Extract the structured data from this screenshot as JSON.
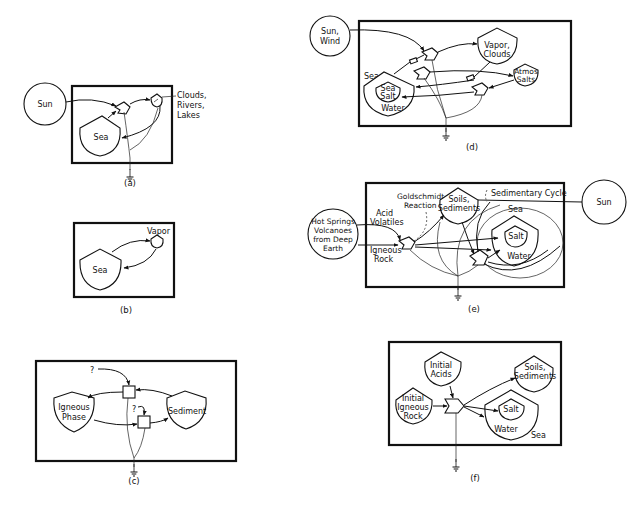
{
  "panels": {
    "a": {
      "caption": "(a)",
      "sun": "Sun",
      "sea": "Sea",
      "clouds_l1": "Clouds,",
      "clouds_l2": "Rivers,",
      "clouds_l3": "Lakes"
    },
    "b": {
      "caption": "(b)",
      "sea": "Sea",
      "vapor": "Vapor"
    },
    "c": {
      "caption": "(c)",
      "igneous_l1": "Igneous",
      "igneous_l2": "Phase",
      "sediment": "Sediment",
      "q1": "?",
      "q2": "?"
    },
    "d": {
      "caption": "(d)",
      "sun_l1": "Sun,",
      "sun_l2": "Wind",
      "sea": "Sea",
      "seasalt_l1": "Sea",
      "seasalt_l2": "Salt",
      "water": "Water",
      "vapor_l1": "Vapor,",
      "vapor_l2": "Clouds",
      "atmos_l1": "Atmos",
      "atmos_l2": "Salts"
    },
    "e": {
      "caption": "(e)",
      "hot_l1": "Hot Springs",
      "hot_l2": "Volcanoes",
      "hot_l3": "from Deep",
      "hot_l4": "Earth",
      "acid_l1": "Acid",
      "acid_l2": "Volatiles",
      "igneous_l1": "Igneous",
      "igneous_l2": "Rock",
      "gold_l1": "Goldschmidt",
      "gold_l2": "Reaction",
      "soils_l1": "Soils,",
      "soils_l2": "Sediments",
      "sedcycle": "Sedimentary Cycle",
      "sea": "Sea",
      "salt": "Salt",
      "water": "Water",
      "sun": "Sun"
    },
    "f": {
      "caption": "(f)",
      "acids_l1": "Initial",
      "acids_l2": "Acids",
      "rock_l1": "Initial",
      "rock_l2": "Igneous",
      "rock_l3": "Rock",
      "soils_l1": "Soils,",
      "soils_l2": "Sediments",
      "salt": "Salt",
      "water": "Water",
      "sea": "Sea"
    }
  }
}
